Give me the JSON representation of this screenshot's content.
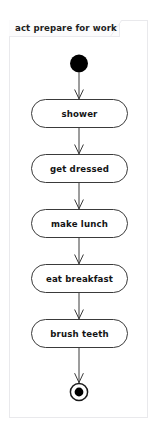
{
  "frame": {
    "title": "act prepare for work",
    "kind": "activity-diagram-frame",
    "border_color": "#e9e9ec",
    "tab_fill": "#fbfbfc"
  },
  "diagram": {
    "type": "uml-activity-diagram",
    "node_stroke": "#3a3a3a",
    "node_fill": "#ffffff",
    "edge_color": "#3a3a3a",
    "initial_node": {
      "name": "initial-node",
      "shape": "filled-circle",
      "cx": 79,
      "cy": 63.5,
      "r": 9,
      "fill": "#000000"
    },
    "final_node": {
      "name": "activity-final-node",
      "shape": "circle-with-inner-dot",
      "cx": 79,
      "cy": 392,
      "outer_r": 9,
      "inner_r": 4.4,
      "fill": "#000000"
    },
    "actions": [
      {
        "id": "shower",
        "label": "shower",
        "x": 31,
        "y": 99,
        "w": 97,
        "h": 29
      },
      {
        "id": "get-dressed",
        "label": "get dressed",
        "x": 31,
        "y": 154,
        "w": 97,
        "h": 29
      },
      {
        "id": "make-lunch",
        "label": "make lunch",
        "x": 31,
        "y": 209,
        "w": 97,
        "h": 29
      },
      {
        "id": "eat-breakfast",
        "label": "eat breakfast",
        "x": 31,
        "y": 264,
        "w": 97,
        "h": 29
      },
      {
        "id": "brush-teeth",
        "label": "brush teeth",
        "x": 31,
        "y": 319,
        "w": 97,
        "h": 29
      }
    ],
    "edges": [
      {
        "from": "initial-node",
        "to": "shower"
      },
      {
        "from": "shower",
        "to": "get-dressed"
      },
      {
        "from": "get-dressed",
        "to": "make-lunch"
      },
      {
        "from": "make-lunch",
        "to": "eat-breakfast"
      },
      {
        "from": "eat-breakfast",
        "to": "brush-teeth"
      },
      {
        "from": "brush-teeth",
        "to": "activity-final-node"
      }
    ]
  }
}
